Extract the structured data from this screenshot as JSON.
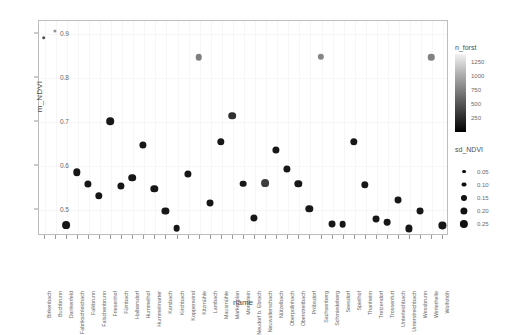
{
  "chart_data": {
    "type": "scatter",
    "title": "",
    "xlabel": "name",
    "ylabel": "m_NDVI",
    "ylim": [
      0.44,
      0.93
    ],
    "yticks": [
      0.5,
      0.6,
      0.7,
      0.8,
      0.9
    ],
    "ytick_labels": [
      "0.5",
      "0.6",
      "0.7",
      "0.8",
      "0.9"
    ],
    "grid": true,
    "categories": [
      "Birkenbach",
      "Buchbrunn",
      "Dankenfeld",
      "Fabrikschleichach",
      "Falkbrunn",
      "Falschenbrunn",
      "Friesenhof",
      "Fürnbach",
      "Halbersdorf",
      "Hummelhof",
      "Hummelmarter",
      "Karsbach",
      "Kirchbach",
      "Koppenwind",
      "Kitzmühle",
      "Lambach",
      "Mausmühle",
      "Markenplan",
      "Mordstein",
      "Neudorf b. Ebrach",
      "Neuwalterschach",
      "Nützelbach",
      "Oberpollnhach",
      "Oberstreitbach",
      "Pröbsdorf",
      "Sachsenberg",
      "Schmiedeberg",
      "Seesdorf",
      "Spielhof",
      "Thanheim",
      "Tretzendorf",
      "Trossenfurt",
      "Unterleichbach",
      "Unterstreichbach",
      "Wessbrunn",
      "Winterhelle",
      "Wolfshöh"
    ],
    "series": [
      {
        "name": "stand",
        "points": [
          {
            "x": "Birkenbach",
            "y": 0.89,
            "sd_NDVI": 0.04,
            "n_forst": 450
          },
          {
            "x": "Buchbrunn",
            "y": 0.905,
            "sd_NDVI": 0.02,
            "n_forst": 900
          },
          {
            "x": "Dankenfeld",
            "y": 0.463,
            "sd_NDVI": 0.23,
            "n_forst": 90
          },
          {
            "x": "Fabrikschleichach",
            "y": 0.583,
            "sd_NDVI": 0.21,
            "n_forst": 80
          },
          {
            "x": "Falkbrunn",
            "y": 0.556,
            "sd_NDVI": 0.2,
            "n_forst": 80
          },
          {
            "x": "Falschenbrunn",
            "y": 0.53,
            "sd_NDVI": 0.21,
            "n_forst": 80
          },
          {
            "x": "Friesenhof",
            "y": 0.7,
            "sd_NDVI": 0.22,
            "n_forst": 90
          },
          {
            "x": "Fürnbach",
            "y": 0.552,
            "sd_NDVI": 0.2,
            "n_forst": 80
          },
          {
            "x": "Halbersdorf",
            "y": 0.571,
            "sd_NDVI": 0.22,
            "n_forst": 80
          },
          {
            "x": "Hummelhof",
            "y": 0.645,
            "sd_NDVI": 0.2,
            "n_forst": 85
          },
          {
            "x": "Hummelmarter",
            "y": 0.545,
            "sd_NDVI": 0.21,
            "n_forst": 80
          },
          {
            "x": "Karsbach",
            "y": 0.494,
            "sd_NDVI": 0.2,
            "n_forst": 85
          },
          {
            "x": "Kirchbach",
            "y": 0.455,
            "sd_NDVI": 0.18,
            "n_forst": 80
          },
          {
            "x": "Koppenwind",
            "y": 0.58,
            "sd_NDVI": 0.2,
            "n_forst": 85
          },
          {
            "x": "Kitzmühle",
            "y": 0.845,
            "sd_NDVI": 0.17,
            "n_forst": 760
          },
          {
            "x": "Lambach",
            "y": 0.512,
            "sd_NDVI": 0.19,
            "n_forst": 80
          },
          {
            "x": "Mausmühle",
            "y": 0.652,
            "sd_NDVI": 0.21,
            "n_forst": 85
          },
          {
            "x": "Markenplan",
            "y": 0.712,
            "sd_NDVI": 0.22,
            "n_forst": 240
          },
          {
            "x": "Mordstein",
            "y": 0.557,
            "sd_NDVI": 0.18,
            "n_forst": 85
          },
          {
            "x": "Neudorf b. Ebrach",
            "y": 0.478,
            "sd_NDVI": 0.2,
            "n_forst": 80
          },
          {
            "x": "Neuwalterschach",
            "y": 0.558,
            "sd_NDVI": 0.23,
            "n_forst": 330
          },
          {
            "x": "Nützelbach",
            "y": 0.633,
            "sd_NDVI": 0.2,
            "n_forst": 85
          },
          {
            "x": "Oberpollnhach",
            "y": 0.59,
            "sd_NDVI": 0.2,
            "n_forst": 85
          },
          {
            "x": "Oberstreitbach",
            "y": 0.556,
            "sd_NDVI": 0.21,
            "n_forst": 85
          },
          {
            "x": "Pröbsdorf",
            "y": 0.5,
            "sd_NDVI": 0.21,
            "n_forst": 90
          },
          {
            "x": "Sachsenberg",
            "y": 0.846,
            "sd_NDVI": 0.16,
            "n_forst": 800
          },
          {
            "x": "Schmiedeberg",
            "y": 0.466,
            "sd_NDVI": 0.19,
            "n_forst": 80
          },
          {
            "x": "Seesdorf",
            "y": 0.464,
            "sd_NDVI": 0.18,
            "n_forst": 80
          },
          {
            "x": "Spielhof",
            "y": 0.652,
            "sd_NDVI": 0.21,
            "n_forst": 85
          },
          {
            "x": "Thanheim",
            "y": 0.555,
            "sd_NDVI": 0.21,
            "n_forst": 85
          },
          {
            "x": "Tretzendorf",
            "y": 0.476,
            "sd_NDVI": 0.19,
            "n_forst": 80
          },
          {
            "x": "Trossenfurt",
            "y": 0.47,
            "sd_NDVI": 0.18,
            "n_forst": 90
          },
          {
            "x": "Unterleichbach",
            "y": 0.52,
            "sd_NDVI": 0.19,
            "n_forst": 85
          },
          {
            "x": "Unterstreichbach",
            "y": 0.455,
            "sd_NDVI": 0.2,
            "n_forst": 85
          },
          {
            "x": "Wessbrunn",
            "y": 0.494,
            "sd_NDVI": 0.19,
            "n_forst": 85
          },
          {
            "x": "Winterhelle",
            "y": 0.845,
            "sd_NDVI": 0.17,
            "n_forst": 780
          },
          {
            "x": "Wolfshöh",
            "y": 0.462,
            "sd_NDVI": 0.2,
            "n_forst": 80
          }
        ]
      }
    ],
    "legends": [
      {
        "name": "n_forst",
        "type": "colorbar",
        "title": "n_forst",
        "ticks": [
          1250,
          1000,
          750,
          500,
          250
        ],
        "tick_labels": [
          "1250",
          "1000",
          "750",
          "500",
          "250"
        ],
        "low_color": "#000000",
        "high_color": "#f2f2f2"
      },
      {
        "name": "sd_NDVI",
        "type": "size",
        "title": "sd_NDVI",
        "ticks": [
          0.05,
          0.1,
          0.15,
          0.2,
          0.25
        ],
        "tick_labels": [
          "0.05",
          "0.10",
          "0.15",
          "0.20",
          "0.25"
        ],
        "color": "#111111"
      }
    ],
    "style": {
      "panel_border": "#bdbdbd",
      "grid_color": "#f6f6f6",
      "axis_text": "#6b6b6b",
      "title_text": "#4d4d4d"
    }
  }
}
